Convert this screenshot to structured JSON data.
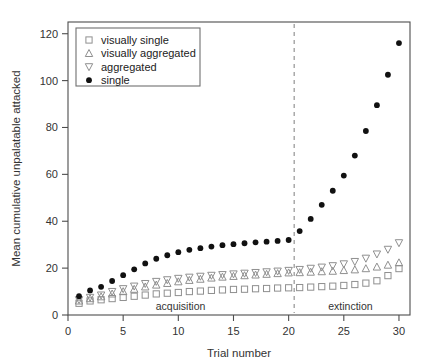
{
  "chart_data": {
    "type": "scatter",
    "title": "",
    "xlabel": "Trial number",
    "ylabel": "Mean cumulative unpalatable attacked",
    "xlim": [
      0,
      31
    ],
    "ylim": [
      0,
      125
    ],
    "xticks": [
      0,
      5,
      10,
      15,
      20,
      25,
      30
    ],
    "yticks": [
      0,
      20,
      40,
      60,
      80,
      100,
      120
    ],
    "grid": false,
    "legend_position": "top-left",
    "x": [
      1,
      2,
      3,
      4,
      5,
      6,
      7,
      8,
      9,
      10,
      11,
      12,
      13,
      14,
      15,
      16,
      17,
      18,
      19,
      20,
      21,
      22,
      23,
      24,
      25,
      26,
      27,
      28,
      29,
      30
    ],
    "series": [
      {
        "name": "visually single",
        "marker": "open-square",
        "color": "#8f8f8f",
        "values": [
          5.0,
          6.0,
          6.5,
          7.0,
          7.5,
          8.0,
          8.5,
          9.0,
          9.3,
          9.6,
          10.0,
          10.2,
          10.5,
          10.7,
          10.9,
          11.0,
          11.2,
          11.3,
          11.5,
          11.6,
          11.7,
          11.9,
          12.1,
          12.3,
          12.6,
          13.0,
          13.6,
          14.6,
          16.8,
          19.8
        ]
      },
      {
        "name": "visually aggregated",
        "marker": "open-triangle-up",
        "color": "#8f8f8f",
        "values": [
          6.0,
          7.0,
          7.8,
          9.0,
          10.0,
          11.0,
          12.0,
          12.8,
          13.5,
          14.2,
          14.8,
          15.3,
          15.8,
          16.2,
          16.5,
          16.8,
          17.1,
          17.4,
          17.7,
          18.0,
          18.1,
          18.3,
          18.5,
          18.7,
          19.0,
          19.3,
          19.8,
          20.5,
          21.3,
          22.3
        ]
      },
      {
        "name": "aggregated",
        "marker": "open-triangle-down",
        "color": "#8f8f8f",
        "values": [
          6.5,
          7.5,
          8.5,
          10.0,
          11.2,
          12.3,
          13.4,
          14.3,
          15.0,
          15.6,
          16.1,
          16.5,
          16.9,
          17.2,
          17.5,
          17.8,
          18.1,
          18.4,
          18.7,
          19.0,
          19.4,
          19.9,
          20.4,
          21.0,
          21.8,
          22.8,
          24.2,
          26.0,
          28.0,
          30.8
        ]
      },
      {
        "name": "single",
        "marker": "filled-circle",
        "color": "#111111",
        "values": [
          8.0,
          10.5,
          12.0,
          14.5,
          17.0,
          19.5,
          22.0,
          24.0,
          25.5,
          26.8,
          27.8,
          28.5,
          29.2,
          29.8,
          30.2,
          30.6,
          31.0,
          31.3,
          31.6,
          32.0,
          35.8,
          41.0,
          47.0,
          53.0,
          59.5,
          68.0,
          78.5,
          89.5,
          102.5,
          116.0
        ]
      }
    ],
    "annotations": [
      {
        "text": "acquisition",
        "x": 10.2,
        "y": 2.0
      },
      {
        "text": "extinction",
        "x": 25.6,
        "y": 2.0
      }
    ],
    "divider": {
      "x": 20.5,
      "style": "dashed"
    }
  },
  "legend": {
    "items": [
      {
        "label": "visually single"
      },
      {
        "label": "visually aggregated"
      },
      {
        "label": "aggregated"
      },
      {
        "label": "single"
      }
    ]
  },
  "axes": {
    "x_title": "Trial number",
    "y_title": "Mean cumulative unpalatable attacked",
    "x_tick_labels": [
      "0",
      "5",
      "10",
      "15",
      "20",
      "25",
      "30"
    ],
    "y_tick_labels": [
      "0",
      "20",
      "40",
      "60",
      "80",
      "100",
      "120"
    ]
  },
  "phases": {
    "acquisition_label": "acquisition",
    "extinction_label": "extinction"
  }
}
